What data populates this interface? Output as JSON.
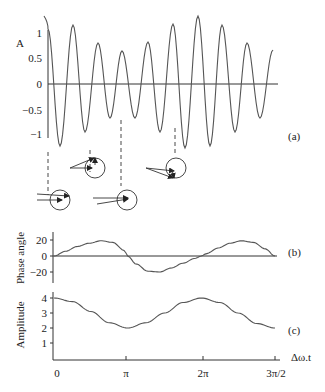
{
  "chart_data": [
    {
      "id": "a",
      "type": "line",
      "title": "",
      "panel_label": "(a)",
      "ylabel": "A",
      "xlabel": "",
      "ylim": [
        -1.25,
        1.35
      ],
      "yticks": [
        1,
        0.5,
        0,
        -0.5,
        -1
      ],
      "ytick_labels": [
        "1",
        "0.5",
        "0",
        "−0.5",
        "−1"
      ],
      "grid": false,
      "description": "Beat signal: sum of two sinusoids with close frequencies; oscillation with slowly varying envelope",
      "x_px_range": [
        48,
        273
      ],
      "carrier_period_px": 25,
      "peaks": [
        {
          "x": 73,
          "y": 1.18
        },
        {
          "x": 98,
          "y": 0.82
        },
        {
          "x": 122,
          "y": 0.66
        },
        {
          "x": 148,
          "y": 0.84
        },
        {
          "x": 173,
          "y": 1.2
        },
        {
          "x": 198,
          "y": 1.36
        },
        {
          "x": 222,
          "y": 1.18
        },
        {
          "x": 247,
          "y": 0.82
        }
      ],
      "troughs": [
        {
          "x": 60,
          "y": -1.24
        },
        {
          "x": 85,
          "y": -0.96
        },
        {
          "x": 110,
          "y": -0.68
        },
        {
          "x": 135,
          "y": -0.68
        },
        {
          "x": 160,
          "y": -0.96
        },
        {
          "x": 185,
          "y": -1.28
        },
        {
          "x": 210,
          "y": -1.24
        },
        {
          "x": 235,
          "y": -0.96
        },
        {
          "x": 260,
          "y": -0.68
        }
      ],
      "phasor_markers": [
        {
          "x": 60,
          "label": "phasors aligned"
        },
        {
          "x": 98,
          "label": "phasor partly rotated"
        },
        {
          "x": 122,
          "label": "phasors opposed"
        },
        {
          "x": 173,
          "label": "phasor rotated"
        }
      ]
    },
    {
      "id": "b",
      "type": "line",
      "panel_label": "(b)",
      "ylabel": "Phase angle",
      "xlabel": "",
      "ylim": [
        -30,
        30
      ],
      "yticks": [
        20,
        0,
        -20
      ],
      "ytick_labels": [
        "20",
        "0",
        "−20"
      ],
      "grid": false,
      "x": [
        0,
        0.5,
        1.0,
        1.5,
        2.0,
        2.5,
        3.0,
        3.14,
        3.5,
        4.0,
        4.5,
        5.0,
        5.5,
        6.0,
        6.28,
        6.5,
        7.0,
        7.5,
        8.0,
        8.5,
        9.0,
        9.42
      ],
      "values": [
        0,
        6,
        12,
        16,
        19,
        17,
        7,
        0,
        -10,
        -19,
        -20,
        -15,
        -9,
        -3,
        0,
        3,
        10,
        16,
        19,
        17,
        9,
        0
      ]
    },
    {
      "id": "c",
      "type": "line",
      "panel_label": "(c)",
      "ylabel": "Amplitude",
      "xlabel": "Δω.t",
      "ylim": [
        0,
        4.5
      ],
      "yticks": [
        4,
        3,
        2,
        1
      ],
      "ytick_labels": [
        "4",
        "3",
        "2",
        "1"
      ],
      "xticks": [
        "0",
        "π",
        "2π",
        "3π/2"
      ],
      "grid": false,
      "x": [
        0,
        0.785,
        1.571,
        2.356,
        3.14,
        3.927,
        4.712,
        5.498,
        6.28,
        7.069,
        7.854,
        8.639,
        9.42
      ],
      "values": [
        4.0,
        3.76,
        3.1,
        2.35,
        2.0,
        2.35,
        3.0,
        3.7,
        4.0,
        3.7,
        3.0,
        2.3,
        2.0
      ]
    }
  ],
  "labels": {
    "a_ylabel": "A",
    "a_panel": "(a)",
    "b_ylabel": "Phase angle",
    "b_panel": "(b)",
    "c_ylabel": "Amplitude",
    "c_panel": "(c)",
    "xaxis_title": "Δω.t",
    "a_ticks": [
      "1",
      "0.5",
      "0",
      "−0.5",
      "−1"
    ],
    "b_ticks": [
      "20",
      "0",
      "−20"
    ],
    "c_ticks": [
      "4",
      "3",
      "2",
      "1"
    ],
    "x_ticks": [
      "0",
      "π",
      "2π",
      "3π/2"
    ]
  },
  "colors": {
    "curve": "#555555",
    "axis": "#333333",
    "text": "#222222"
  }
}
